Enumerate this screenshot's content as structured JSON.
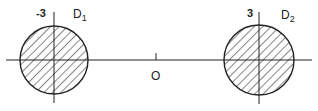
{
  "diagram": {
    "axis": {
      "origin_label": "O"
    },
    "discs": [
      {
        "name": "D",
        "subscript": "1",
        "center_label": "-3",
        "fill": "hatched"
      },
      {
        "name": "D",
        "subscript": "2",
        "center_label": "3",
        "fill": "hatched"
      }
    ]
  },
  "colors": {
    "stroke": "#222222",
    "background": "#ffffff"
  }
}
